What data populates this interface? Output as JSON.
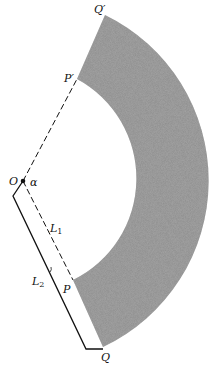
{
  "diagram": {
    "type": "annular-sector",
    "labels": {
      "O": "O",
      "alpha": "α",
      "P": "P",
      "P_prime": "P′",
      "Q": "Q",
      "Q_prime": "Q′",
      "L1_main": "L",
      "L1_sub": "1",
      "L2_main": "L",
      "L2_sub": "2"
    },
    "colors": {
      "fill": "#8c8c8c",
      "line": "#111111",
      "background": "#ffffff"
    },
    "geometry": {
      "center": [
        23,
        181
      ],
      "inner_radius": 113,
      "outer_radius": 184
    }
  }
}
